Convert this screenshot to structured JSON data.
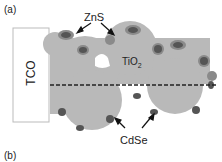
{
  "figure": {
    "panel_a_label": "(a)",
    "panel_b_label": "(b)",
    "labels": {
      "electrode": "TCO",
      "semiconductor": "TiO",
      "semiconductor_sub": "2",
      "shell": "ZnS",
      "quantum_dots": "CdSe"
    },
    "colors": {
      "tco_fill": "#ffffff",
      "tco_border": "#bbbbbb",
      "tio2_fill": "#b9b9b9",
      "cdse_fill": "#555555",
      "zns_fill": "#8a8a8a",
      "dashed_line": "#222222",
      "arrow": "#111111"
    }
  }
}
